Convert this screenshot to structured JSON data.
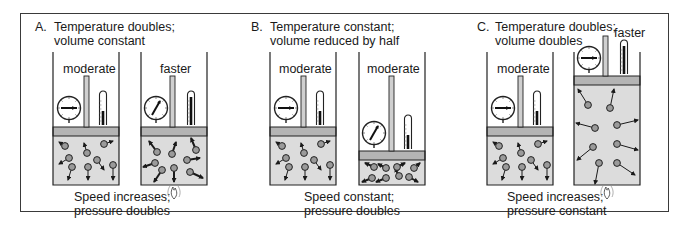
{
  "panels": [
    {
      "letter": "A.",
      "title_line1": "Temperature doubles;",
      "title_line2": "volume constant",
      "left_label": "moderate",
      "right_label": "faster",
      "caption_line1": "Speed increases;",
      "caption_line2": "pressure doubles",
      "heated": true
    },
    {
      "letter": "B.",
      "title_line1": "Temperature constant;",
      "title_line2": "volume reduced by half",
      "left_label": "moderate",
      "right_label": "moderate",
      "caption_line1": "Speed constant;",
      "caption_line2": "pressure doubles",
      "heated": false
    },
    {
      "letter": "C.",
      "title_line1": "Temperature doubles;",
      "title_line2": "volume doubles",
      "left_label": "moderate",
      "right_label": "faster",
      "caption_line1": "Speed increases;",
      "caption_line2": "pressure constant",
      "heated": true
    }
  ],
  "colors": {
    "gas": "#dcdcdc",
    "piston": "#b4b4b4",
    "line": "#2a2a2a",
    "molecule": "#9a9a9a"
  }
}
